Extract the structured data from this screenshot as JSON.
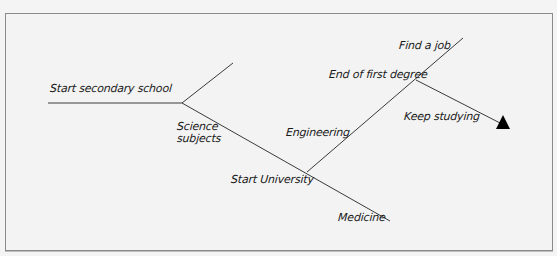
{
  "diagram": {
    "type": "decision-tree",
    "nodes": {
      "start_secondary": "Start secondary school",
      "science_line1": "Science",
      "science_line2": "subjects",
      "start_university": "Start University",
      "engineering": "Engineering",
      "medicine": "Medicine",
      "end_first_degree": "End of first degree",
      "find_job": "Find a job",
      "keep_studying": "Keep studying"
    },
    "edges": [
      {
        "from": "Start secondary school",
        "to": "Science subjects"
      },
      {
        "from": "Science subjects",
        "to": "Start University"
      },
      {
        "from": "Start University",
        "to": "Engineering"
      },
      {
        "from": "Start University",
        "to": "Medicine"
      },
      {
        "from": "Engineering",
        "to": "End of first degree"
      },
      {
        "from": "End of first degree",
        "to": "Find a job"
      },
      {
        "from": "End of first degree",
        "to": "Keep studying"
      }
    ],
    "colors": {
      "line": "#3a3a3a",
      "arrow": "#000000",
      "background": "#f3f3f3",
      "border": "#8a8a8a"
    }
  }
}
